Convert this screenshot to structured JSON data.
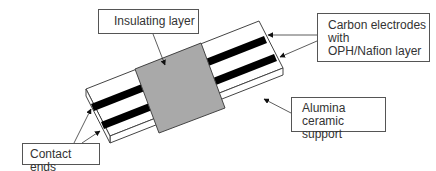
{
  "diagram": {
    "type": "sensor-schematic",
    "labels": {
      "insulating_layer": "Insulating layer",
      "carbon_electrodes": [
        "Carbon electrodes",
        "with",
        "OPH/Nafion layer"
      ],
      "alumina_support": [
        "Alumina",
        "ceramic support"
      ],
      "contact_ends": "Contact ends"
    },
    "colors": {
      "insulating_layer_fill": "#a9a9a9",
      "electrode_fill": "#000000",
      "support_fill": "#ffffff",
      "outline": "#444444"
    }
  }
}
